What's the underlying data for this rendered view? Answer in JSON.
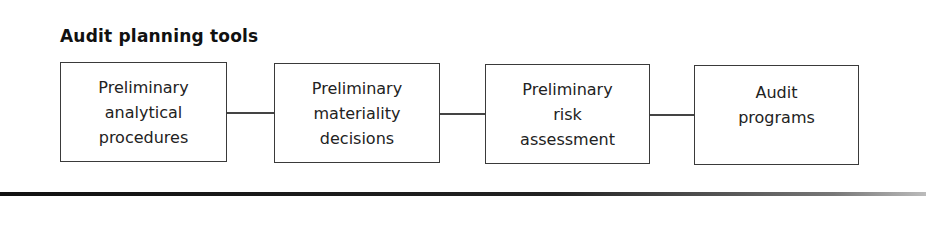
{
  "title": "Audit planning tools",
  "boxes": [
    {
      "lines": [
        "Preliminary",
        "analytical",
        "procedures"
      ]
    },
    {
      "lines": [
        "Preliminary",
        "materiality",
        "decisions"
      ]
    },
    {
      "lines": [
        "Preliminary",
        "risk",
        "assessment"
      ]
    },
    {
      "lines": [
        "Audit",
        "programs"
      ]
    }
  ],
  "colors": {
    "border": "#3a3a3a",
    "text": "#222222",
    "background": "#ffffff"
  }
}
